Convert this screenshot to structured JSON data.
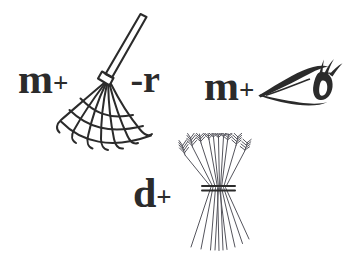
{
  "page": {
    "kind": "rebus-puzzle",
    "background_color": "#ffffff",
    "ink_color": "#2b2b2b",
    "hairline_color": "#55555d",
    "width": 364,
    "height": 256
  },
  "puzzles": [
    {
      "id": "rake-equation",
      "tokens": [
        {
          "type": "letter",
          "text": "m"
        },
        {
          "type": "operator",
          "text": "+"
        },
        {
          "type": "picture",
          "icon": "rake-icon",
          "name": "rake"
        },
        {
          "type": "operator",
          "text": "-"
        },
        {
          "type": "letter",
          "text": "r"
        }
      ],
      "lead_letter": "m",
      "plus_sign": "+",
      "minus_r": "-r"
    },
    {
      "id": "eye-equation",
      "tokens": [
        {
          "type": "letter",
          "text": "m"
        },
        {
          "type": "operator",
          "text": "+"
        },
        {
          "type": "picture",
          "icon": "eye-icon",
          "name": "eye"
        }
      ],
      "lead_letter": "m",
      "plus_sign": "+"
    },
    {
      "id": "sheaf-equation",
      "tokens": [
        {
          "type": "letter",
          "text": "d"
        },
        {
          "type": "operator",
          "text": "+"
        },
        {
          "type": "picture",
          "icon": "wheat-sheaf-icon",
          "name": "wheat sheaf"
        }
      ],
      "lead_letter": "d",
      "plus_sign": "+"
    }
  ]
}
